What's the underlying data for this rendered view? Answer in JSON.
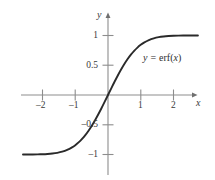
{
  "figure": {
    "kind": "math-function-plot",
    "background_color": "#ffffff",
    "axis_color": "#8a8a8a",
    "curve_color": "#2a2a2a",
    "text_color": "#3a3a3a",
    "width": 215,
    "height": 180
  },
  "axes": {
    "x_axis_name": "x",
    "y_axis_name": "y",
    "x_ticks": [
      {
        "value": -2,
        "label": "–2"
      },
      {
        "value": -1,
        "label": "–1"
      },
      {
        "value": 1,
        "label": "1"
      },
      {
        "value": 2,
        "label": "2"
      }
    ],
    "y_ticks": [
      {
        "value": 1,
        "label": "1"
      },
      {
        "value": 0.5,
        "label": "0.5"
      },
      {
        "value": -0.5,
        "label": "–0.5"
      },
      {
        "value": -1,
        "label": "–1"
      }
    ]
  },
  "annotations": {
    "curve_label_y": "y",
    "curve_label_equals": "=",
    "curve_label_fn": "erf(",
    "curve_label_var": "x",
    "curve_label_close": ")",
    "curve_label_full": "y = erf(x)"
  },
  "chart_data": {
    "type": "line",
    "title": "",
    "subtitle": "",
    "xlabel": "x",
    "ylabel": "y",
    "xlim": [
      -2.65,
      2.75
    ],
    "ylim": [
      -1.4,
      1.4
    ],
    "grid": false,
    "legend": false,
    "annotations": [
      "y = erf(x)"
    ],
    "xticks": [
      -2,
      -1,
      1,
      2
    ],
    "xticklabels": [
      "–2",
      "–1",
      "1",
      "2"
    ],
    "yticks": [
      1,
      0.5,
      -0.5,
      -1
    ],
    "yticklabels": [
      "1",
      "0.5",
      "–0.5",
      "–1"
    ],
    "series": [
      {
        "name": "y = erf(x)",
        "color": "#2a2a2a",
        "x": [
          -2.6,
          -2.45,
          -2.3,
          -2.15,
          -2.0,
          -1.85,
          -1.7,
          -1.55,
          -1.4,
          -1.25,
          -1.1,
          -1.0,
          -0.9,
          -0.8,
          -0.7,
          -0.6,
          -0.5,
          -0.4,
          -0.3,
          -0.2,
          -0.1,
          0.0,
          0.1,
          0.2,
          0.3,
          0.4,
          0.5,
          0.6,
          0.7,
          0.8,
          0.9,
          1.0,
          1.1,
          1.25,
          1.4,
          1.55,
          1.7,
          1.85,
          2.0,
          2.15,
          2.3,
          2.45,
          2.6,
          2.75
        ],
        "y": [
          -0.9998,
          -0.9995,
          -0.9989,
          -0.9976,
          -0.9953,
          -0.9911,
          -0.9838,
          -0.9716,
          -0.9523,
          -0.9229,
          -0.8802,
          -0.8427,
          -0.7969,
          -0.7421,
          -0.6778,
          -0.6039,
          -0.5205,
          -0.4284,
          -0.3286,
          -0.2227,
          -0.1125,
          0.0,
          0.1125,
          0.2227,
          0.3286,
          0.4284,
          0.5205,
          0.6039,
          0.6778,
          0.7421,
          0.7969,
          0.8427,
          0.8802,
          0.9229,
          0.9523,
          0.9716,
          0.9838,
          0.9911,
          0.9953,
          0.9976,
          0.9989,
          0.9995,
          0.9998,
          0.9999
        ]
      }
    ]
  }
}
